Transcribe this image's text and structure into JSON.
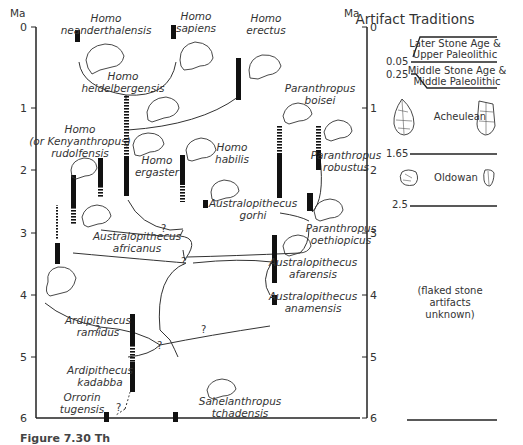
{
  "figure": {
    "axis_unit": "Ma",
    "ticks": [
      "0",
      "1",
      "2",
      "3",
      "4",
      "5",
      "6"
    ],
    "caption_partial": "Figure 7.30  Th"
  },
  "species": [
    {
      "id": "neanderthalensis",
      "genus": "Homo",
      "name": "neanderthalensis"
    },
    {
      "id": "sapiens",
      "genus": "Homo",
      "name": "sapiens"
    },
    {
      "id": "erectus",
      "genus": "Homo",
      "name": "erectus"
    },
    {
      "id": "heidelbergensis",
      "genus": "Homo",
      "name": "heidelbergensis"
    },
    {
      "id": "rudolfensis",
      "genus": "Homo",
      "alt": "(or Kenyanthropus)",
      "name": "rudolfensis"
    },
    {
      "id": "ergaster",
      "genus": "Homo",
      "name": "ergaster"
    },
    {
      "id": "habilis",
      "genus": "Homo",
      "name": "habilis"
    },
    {
      "id": "boisei",
      "genus": "Paranthropus",
      "name": "boisei"
    },
    {
      "id": "robustus",
      "genus": "Paranthropus",
      "name": "robustus"
    },
    {
      "id": "gorhi",
      "genus": "Australopithecus",
      "name": "gorhi"
    },
    {
      "id": "aethiopicus",
      "genus": "Paranthropus",
      "name": "oethiopicus"
    },
    {
      "id": "africanus",
      "genus": "Australopithecus",
      "name": "africanus"
    },
    {
      "id": "afarensis",
      "genus": "Australopithecus",
      "name": "afarensis"
    },
    {
      "id": "anamensis",
      "genus": "Australopithecus",
      "name": "anamensis"
    },
    {
      "id": "ramidus",
      "genus": "Ardipithecus",
      "name": "ramidus"
    },
    {
      "id": "kadabba",
      "genus": "Ardipithecus",
      "name": "kadabba"
    },
    {
      "id": "tugensis",
      "genus": "Orrorin",
      "name": "tugensis"
    },
    {
      "id": "tchadensis",
      "genus": "Sahelanthropus",
      "name": "tchadensis"
    }
  ],
  "uncertain_mark": "?",
  "artifacts": {
    "title": "Artifact Traditions",
    "boundaries": [
      "0.05",
      "0.25",
      "1.65",
      "2.5"
    ],
    "traditions": [
      {
        "line1": "Later Stone Age &",
        "line2": "Upper Paleolithic"
      },
      {
        "line1": "Middle Stone Age &",
        "line2": "Middle Paleolithic"
      },
      {
        "line1": "Acheulean",
        "line2": ""
      },
      {
        "line1": "Oldowan",
        "line2": ""
      }
    ],
    "unknown": [
      "(flaked stone",
      "artifacts",
      "unknown)"
    ]
  }
}
